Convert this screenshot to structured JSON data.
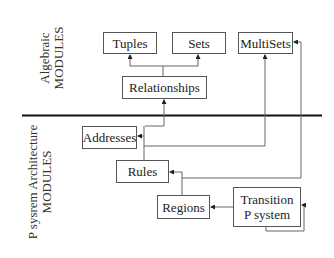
{
  "sections": {
    "algebraic": {
      "line1": "Algebraic",
      "line2": "MODULES"
    },
    "psystem": {
      "line1": "P sysrem Architecture",
      "line2": "MODULES"
    }
  },
  "nodes": {
    "tuples": "Tuples",
    "sets": "Sets",
    "multisets": "MultiSets",
    "relationships": "Relationships",
    "addresses": "Addresses",
    "rules": "Rules",
    "regions": "Regions",
    "transition_line1": "Transition",
    "transition_line2": "P system"
  },
  "edges": [
    {
      "from": "Relationships",
      "to": "Tuples"
    },
    {
      "from": "Relationships",
      "to": "Sets"
    },
    {
      "from": "Addresses",
      "to": "Relationships"
    },
    {
      "from": "Rules",
      "to": "Addresses"
    },
    {
      "from": "Rules",
      "to": "MultiSets"
    },
    {
      "from": "Regions",
      "to": "Rules"
    },
    {
      "from": "Transition P system",
      "to": "Regions"
    },
    {
      "from": "Transition P system",
      "to": "Rules"
    },
    {
      "from": "Transition P system",
      "to": "MultiSets"
    },
    {
      "from": "Transition P system",
      "to": "Transition P system"
    }
  ]
}
